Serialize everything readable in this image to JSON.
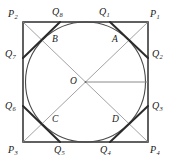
{
  "figure": {
    "type": "geometry-diagram",
    "canvas": {
      "width": 172,
      "height": 164
    },
    "colors": {
      "background": "#ffffff",
      "square_stroke": "#3a3a3a",
      "circle_stroke": "#4a4a4a",
      "diagonal_stroke": "#8a8a8a",
      "chord_stroke": "#2b2b2b",
      "radius_stroke": "#8a8a8a",
      "label_color": "#1a1a1a"
    },
    "geometry": {
      "square": {
        "left": 23,
        "top": 22,
        "right": 148,
        "bottom": 142
      },
      "circle": {
        "cx": 85.5,
        "cy": 82,
        "r": 60
      },
      "center": {
        "x": 85.5,
        "y": 82
      }
    }
  },
  "labels": {
    "corners": [
      {
        "name": "P1",
        "base": "P",
        "sub": "1",
        "x": 150,
        "y": 9
      },
      {
        "name": "P2",
        "base": "P",
        "sub": "2",
        "x": 8,
        "y": 9
      },
      {
        "name": "P3",
        "base": "P",
        "sub": "3",
        "x": 8,
        "y": 145
      },
      {
        "name": "P4",
        "base": "P",
        "sub": "4",
        "x": 150,
        "y": 145
      }
    ],
    "edge_points": [
      {
        "name": "Q1",
        "base": "Q",
        "sub": "1",
        "x": 99,
        "y": 7
      },
      {
        "name": "Q2",
        "base": "Q",
        "sub": "2",
        "x": 152,
        "y": 49
      },
      {
        "name": "Q3",
        "base": "Q",
        "sub": "3",
        "x": 152,
        "y": 101
      },
      {
        "name": "Q4",
        "base": "Q",
        "sub": "4",
        "x": 100,
        "y": 145
      },
      {
        "name": "Q5",
        "base": "Q",
        "sub": "5",
        "x": 54,
        "y": 145
      },
      {
        "name": "Q6",
        "base": "Q",
        "sub": "6",
        "x": 5,
        "y": 101
      },
      {
        "name": "Q7",
        "base": "Q",
        "sub": "7",
        "x": 5,
        "y": 49
      },
      {
        "name": "Q8",
        "base": "Q",
        "sub": "8",
        "x": 52,
        "y": 7
      }
    ],
    "inner_points": [
      {
        "name": "A",
        "base": "A",
        "sub": "",
        "x": 112,
        "y": 35
      },
      {
        "name": "B",
        "base": "B",
        "sub": "",
        "x": 52,
        "y": 35
      },
      {
        "name": "C",
        "base": "C",
        "sub": "",
        "x": 52,
        "y": 115
      },
      {
        "name": "D",
        "base": "D",
        "sub": "",
        "x": 112,
        "y": 115
      }
    ],
    "center_point": {
      "name": "O",
      "base": "O",
      "sub": "",
      "x": 70,
      "y": 77
    }
  },
  "strokes": {
    "square_width": 1.6,
    "circle_width": 1.1,
    "diagonal_width": 0.8,
    "chord_width": 2.0,
    "radius_width": 1.0
  }
}
